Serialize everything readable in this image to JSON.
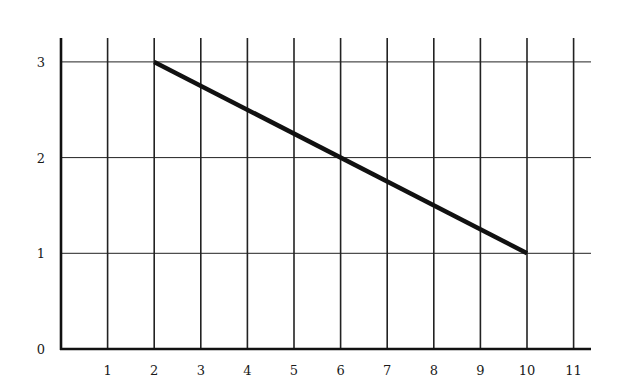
{
  "chart_data": {
    "type": "line",
    "title": "",
    "xlabel": "",
    "ylabel": "",
    "xlim": [
      0,
      11
    ],
    "ylim": [
      0,
      3
    ],
    "x_ticks": [
      1,
      2,
      3,
      4,
      5,
      6,
      7,
      8,
      9,
      10,
      11
    ],
    "y_ticks": [
      0,
      1,
      2,
      3
    ],
    "grid": true,
    "legend": null,
    "series": [
      {
        "name": "line",
        "x": [
          2,
          10
        ],
        "y": [
          3,
          1
        ],
        "color": "#111111"
      }
    ]
  },
  "colors": {
    "grid": "#222222",
    "axis": "#111111",
    "line": "#111111",
    "background": "#ffffff"
  }
}
